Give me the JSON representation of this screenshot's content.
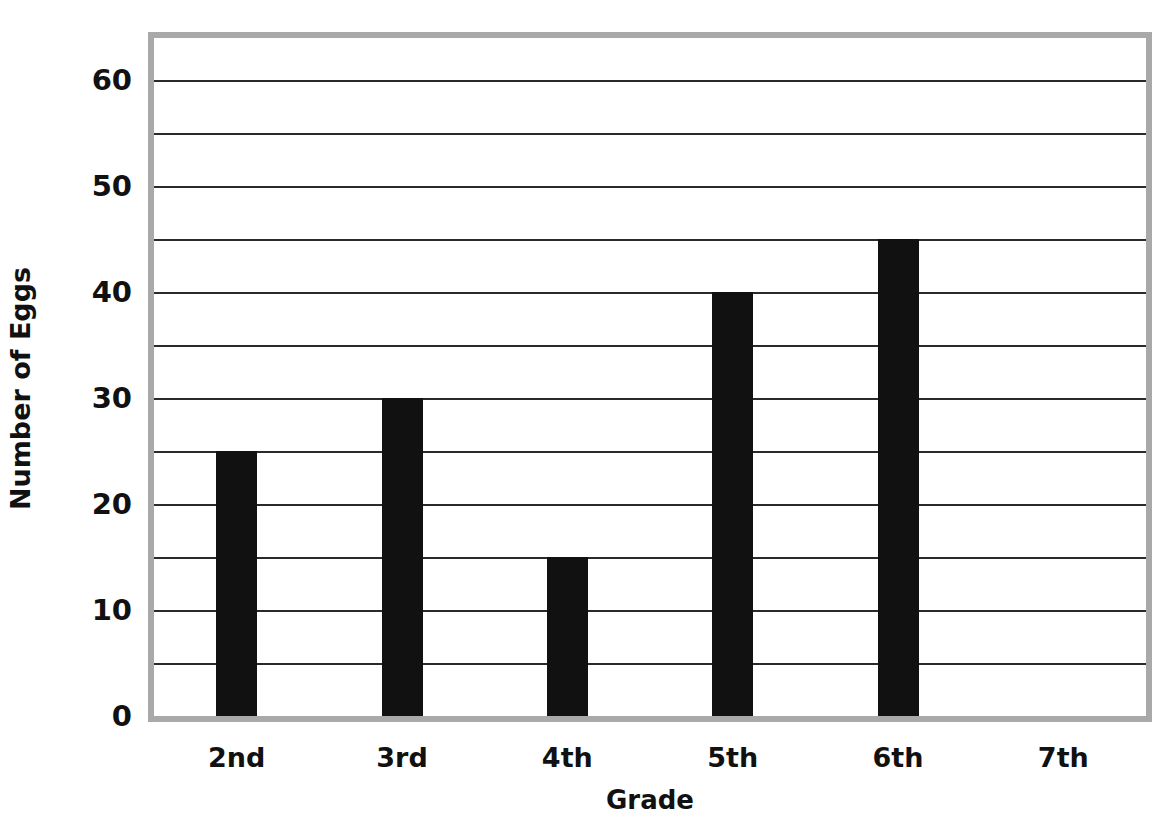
{
  "chart_data": {
    "type": "bar",
    "title": "",
    "xlabel": "Grade",
    "ylabel": "Number of Eggs",
    "categories": [
      "2nd",
      "3rd",
      "4th",
      "5th",
      "6th",
      "7th"
    ],
    "values": [
      25,
      30,
      15,
      40,
      45,
      0
    ],
    "ylim": [
      0,
      64
    ],
    "ytick_labels": [
      "60",
      "50",
      "40",
      "30",
      "20",
      "10",
      "0"
    ],
    "ytick_values": [
      60,
      50,
      40,
      30,
      20,
      10,
      0
    ],
    "gridlines": [
      60,
      55,
      50,
      45,
      40,
      35,
      30,
      25,
      20,
      15,
      10,
      5
    ],
    "grid": true,
    "legend": "none",
    "bar_color": "#111111",
    "frame_color": "#a9a9a9",
    "gridline_color": "#2a2a2a",
    "background_color": "#ffffff"
  }
}
